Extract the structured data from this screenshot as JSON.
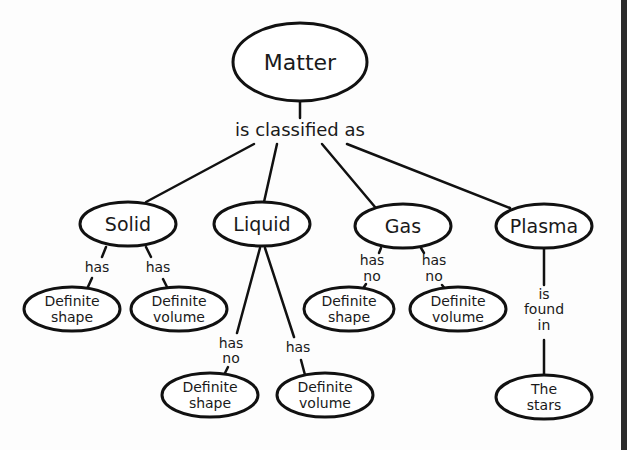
{
  "diagram": {
    "root": {
      "label": "Matter"
    },
    "root_link": "is classified as",
    "states": [
      {
        "label": "Solid",
        "children": [
          {
            "link": [
              "has"
            ],
            "label": [
              "Definite",
              "shape"
            ]
          },
          {
            "link": [
              "has"
            ],
            "label": [
              "Definite",
              "volume"
            ]
          }
        ]
      },
      {
        "label": "Liquid",
        "children": [
          {
            "link": [
              "has",
              "no"
            ],
            "label": [
              "Definite",
              "shape"
            ]
          },
          {
            "link": [
              "has"
            ],
            "label": [
              "Definite",
              "volume"
            ]
          }
        ]
      },
      {
        "label": "Gas",
        "children": [
          {
            "link": [
              "has",
              "no"
            ],
            "label": [
              "Definite",
              "shape"
            ]
          },
          {
            "link": [
              "has",
              "no"
            ],
            "label": [
              "Definite",
              "volume"
            ]
          }
        ]
      },
      {
        "label": "Plasma",
        "children": [
          {
            "link": [
              "is",
              "found",
              "in"
            ],
            "label": [
              "The",
              "stars"
            ]
          }
        ]
      }
    ],
    "colors": {
      "stroke": "#111111",
      "fill": "#ffffff",
      "background": "#fdfdfd",
      "edge_bar": "#2b2b2b"
    }
  }
}
